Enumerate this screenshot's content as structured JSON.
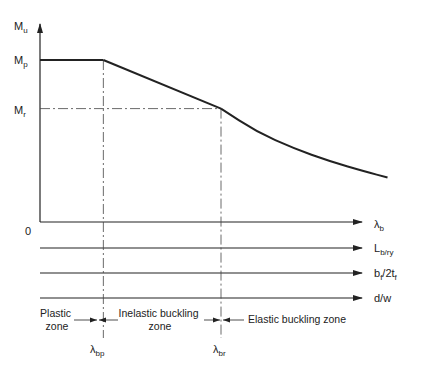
{
  "chart_data": {
    "type": "line",
    "title": "",
    "y_axis": {
      "label_main": "M",
      "label_sub": "u"
    },
    "x_axes": [
      {
        "label_main": "λ",
        "label_sub": "b"
      },
      {
        "label_main": "L",
        "label_sub": "b/ry"
      },
      {
        "label_main": "b",
        "label_sub": "f",
        "label_rest": "/2t",
        "label_sub2": "f"
      },
      {
        "label_main": "d/w",
        "label_sub": ""
      }
    ],
    "origin_label": "0",
    "y_levels": [
      {
        "name": "Mp",
        "main": "M",
        "sub": "p",
        "value": 1.0
      },
      {
        "name": "Mr",
        "main": "M",
        "sub": "r",
        "value": 0.7
      }
    ],
    "x_markers": [
      {
        "name": "lambda_bp",
        "main": "λ",
        "sub": "bp",
        "value": 0.35
      },
      {
        "name": "lambda_br",
        "main": "λ",
        "sub": "br",
        "value": 1.0
      }
    ],
    "curve": {
      "plastic": [
        [
          0.0,
          1.0
        ],
        [
          0.35,
          1.0
        ]
      ],
      "inelastic": [
        [
          0.35,
          1.0
        ],
        [
          1.0,
          0.7
        ]
      ],
      "elastic": [
        [
          1.0,
          0.7
        ],
        [
          1.2,
          0.555
        ],
        [
          1.4,
          0.455
        ],
        [
          1.6,
          0.375
        ],
        [
          1.8,
          0.31
        ],
        [
          1.92,
          0.275
        ]
      ]
    },
    "xlim": [
      0,
      1.95
    ],
    "ylim": [
      0,
      1.3
    ],
    "zones": [
      {
        "name": "plastic-zone",
        "lines": [
          "Plastic",
          "zone"
        ]
      },
      {
        "name": "inelastic-zone",
        "lines": [
          "Inelastic buckling",
          "zone"
        ]
      },
      {
        "name": "elastic-zone",
        "lines": [
          "Elastic buckling zone"
        ]
      }
    ]
  }
}
